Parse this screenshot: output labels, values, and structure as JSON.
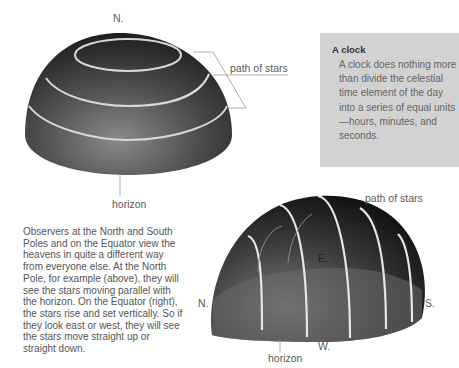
{
  "figure_top": {
    "labels": {
      "north": "N.",
      "path_of_stars": "path of stars",
      "horizon": "horizon"
    },
    "description": "Dome of sky at the North Pole with star paths parallel to the horizon"
  },
  "figure_bottom": {
    "labels": {
      "path_of_stars": "path of stars",
      "east": "E.",
      "north": "N.",
      "south": "S.",
      "west": "W.",
      "horizon": "horizon"
    },
    "description": "Dome of sky at the Equator with star paths rising vertically"
  },
  "sidebar": {
    "title": "A clock",
    "body": "A clock does nothing more than divide the celestial time element of the day into a series of equal units—hours, minutes, and seconds.",
    "background": "#d2d2d2"
  },
  "body_text": "Observers at the North and South Poles and on the Equator view the heavens in quite a different way from everyone else. At the North Pole, for example (above), they will see the stars moving parallel with the horizon. On the Equator (right), the stars rise and set vertically. So if they look east or west, they will see the stars move straight up or straight down."
}
